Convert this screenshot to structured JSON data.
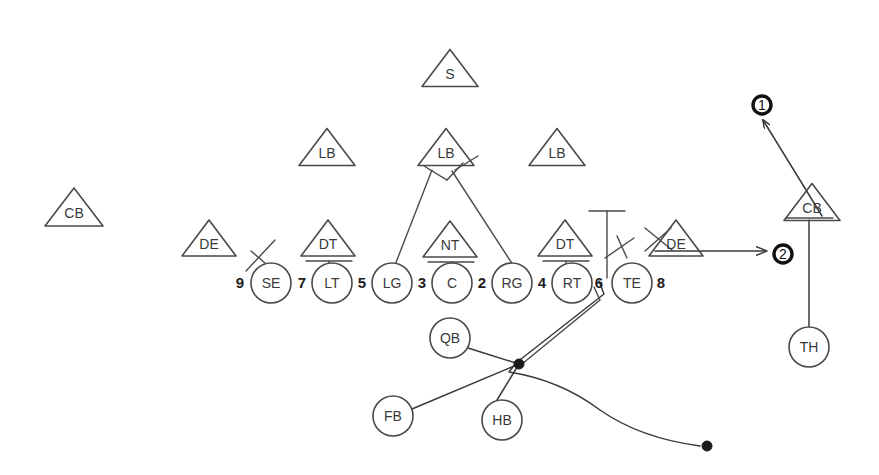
{
  "diagram": {
    "type": "football-play-diagram",
    "title": "",
    "canvas": {
      "width": 879,
      "height": 475
    },
    "colors": {
      "stroke": "#4a4a4a",
      "route": "#3a3a3a",
      "accent": "#111111",
      "background": "#ffffff"
    }
  },
  "offense": {
    "description": "Offensive line and backfield, circle markers",
    "linemen": [
      {
        "label": "SE",
        "cx": 271,
        "cy": 283,
        "r": 20
      },
      {
        "label": "LT",
        "cx": 332,
        "cy": 283,
        "r": 20
      },
      {
        "label": "LG",
        "cx": 392,
        "cy": 283,
        "r": 20
      },
      {
        "label": "C",
        "cx": 452,
        "cy": 283,
        "r": 20
      },
      {
        "label": "RG",
        "cx": 512,
        "cy": 283,
        "r": 20
      },
      {
        "label": "RT",
        "cx": 572,
        "cy": 283,
        "r": 20
      },
      {
        "label": "TE",
        "cx": 632,
        "cy": 283,
        "r": 20
      }
    ],
    "backs": [
      {
        "label": "QB",
        "cx": 450,
        "cy": 338,
        "r": 20
      },
      {
        "label": "FB",
        "cx": 393,
        "cy": 416,
        "r": 20
      },
      {
        "label": "HB",
        "cx": 502,
        "cy": 420,
        "r": 20
      },
      {
        "label": "TH",
        "cx": 809,
        "cy": 347,
        "r": 20
      }
    ]
  },
  "gap_numbers": [
    {
      "value": "9",
      "x": 240,
      "y": 284
    },
    {
      "value": "7",
      "x": 302,
      "y": 284
    },
    {
      "value": "5",
      "x": 362,
      "y": 284
    },
    {
      "value": "3",
      "x": 422,
      "y": 284
    },
    {
      "value": "2",
      "x": 482,
      "y": 284
    },
    {
      "value": "4",
      "x": 542,
      "y": 284
    },
    {
      "value": "6",
      "x": 599,
      "y": 284
    },
    {
      "value": "8",
      "x": 661,
      "y": 284
    }
  ],
  "defense": {
    "description": "Defensive players drawn as triangles",
    "players": [
      {
        "label": "S",
        "cx": 450,
        "cy": 68,
        "halfw": 28,
        "h": 37
      },
      {
        "label": "LB",
        "cx": 327,
        "cy": 147,
        "halfw": 28,
        "h": 37
      },
      {
        "label": "LB",
        "cx": 446,
        "cy": 147,
        "halfw": 28,
        "h": 37
      },
      {
        "label": "LB",
        "cx": 557,
        "cy": 147,
        "halfw": 28,
        "h": 37
      },
      {
        "label": "CB",
        "cx": 74,
        "cy": 207,
        "halfw": 29,
        "h": 38
      },
      {
        "label": "DE",
        "cx": 209,
        "cy": 238,
        "halfw": 27,
        "h": 36
      },
      {
        "label": "DT",
        "cx": 328,
        "cy": 238,
        "halfw": 27,
        "h": 36
      },
      {
        "label": "NT",
        "cx": 450,
        "cy": 239,
        "halfw": 27,
        "h": 36
      },
      {
        "label": "DT",
        "cx": 565,
        "cy": 238,
        "halfw": 27,
        "h": 36
      },
      {
        "label": "DE",
        "cx": 676,
        "cy": 238,
        "halfw": 27,
        "h": 36
      },
      {
        "label": "CB",
        "cx": 812,
        "cy": 202,
        "halfw": 28,
        "h": 37
      }
    ]
  },
  "markers": {
    "description": "Bold circled route-order numbers",
    "items": [
      {
        "value": "1",
        "cx": 762,
        "cy": 105,
        "r": 9
      },
      {
        "value": "2",
        "cx": 783,
        "cy": 254,
        "r": 9
      }
    ]
  },
  "assignments": {
    "description": "Blocking and route lines connecting players",
    "notes": [
      "DT over LT blocked with T-stem",
      "NT over C blocked with T-stem",
      "DT over RT blocked with T-stem",
      "Middle LB keyed by LG and RG in a V",
      "SE and TE show release ticks",
      "TH runs a vertical stem then breaks deep to marker 1",
      "Ball carrier path sweeps right to the end point"
    ]
  }
}
